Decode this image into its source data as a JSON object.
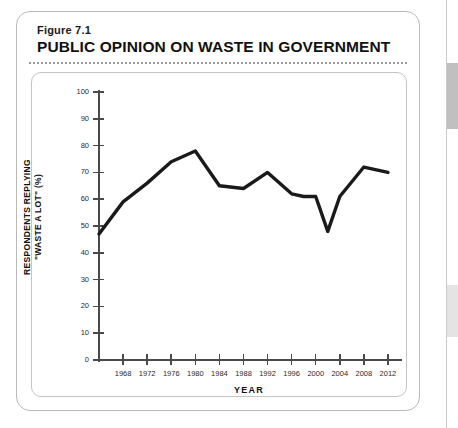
{
  "figure": {
    "number": "Figure 7.1",
    "title": "PUBLIC OPINION ON WASTE IN GOVERNMENT"
  },
  "chart_data": {
    "type": "line",
    "title": "PUBLIC OPINION ON WASTE IN GOVERNMENT",
    "xlabel": "YEAR",
    "ylabel": "RESPONDENTS REPLYING \"WASTE A LOT\" (%)",
    "ylabel_line1": "RESPONDENTS REPLYING",
    "ylabel_line2": "\"WASTE A LOT\" (%)",
    "xlim": [
      1964,
      2014
    ],
    "ylim": [
      0,
      100
    ],
    "ytick_step": 10,
    "grid": false,
    "legend": false,
    "line_color": "#1a1a1a",
    "yticks": [
      0,
      10,
      20,
      30,
      40,
      50,
      60,
      70,
      80,
      90,
      100
    ],
    "xticks": [
      1968,
      1972,
      1976,
      1980,
      1984,
      1988,
      1992,
      1996,
      2000,
      2004,
      2008,
      2012
    ],
    "x": [
      1964,
      1968,
      1972,
      1976,
      1980,
      1984,
      1988,
      1992,
      1996,
      1998,
      2000,
      2002,
      2004,
      2008,
      2012
    ],
    "values": [
      47,
      59,
      66,
      74,
      78,
      65,
      64,
      70,
      62,
      61,
      61,
      48,
      61,
      72,
      70
    ],
    "series": [
      {
        "name": "Waste a lot",
        "x": [
          1964,
          1968,
          1972,
          1976,
          1980,
          1984,
          1988,
          1992,
          1996,
          1998,
          2000,
          2002,
          2004,
          2008,
          2012
        ],
        "values": [
          47,
          59,
          66,
          74,
          78,
          65,
          64,
          70,
          62,
          61,
          61,
          48,
          61,
          72,
          70
        ]
      }
    ]
  }
}
